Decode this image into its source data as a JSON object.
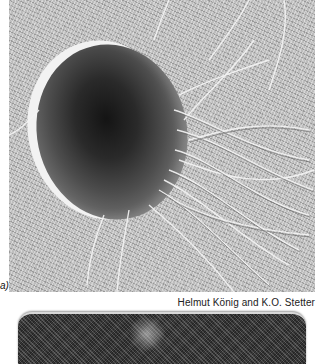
{
  "figure": {
    "panel_a_label": "a)",
    "credit": "Helmut König and K.O. Stetter",
    "panel_a_description": "Electron micrograph (shadowed) of a coccoid cell with numerous flagella",
    "panel_b_description": "Electron micrograph of a rod-shaped cell (partially visible)"
  }
}
